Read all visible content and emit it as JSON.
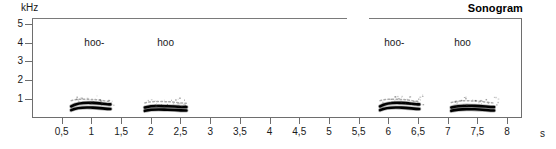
{
  "title": "Sonogram",
  "axes": {
    "y_unit": "kHz",
    "x_unit": "s",
    "y_ticks": [
      {
        "value": 5,
        "label": "5"
      },
      {
        "value": 4,
        "label": "4"
      },
      {
        "value": 3,
        "label": "3"
      },
      {
        "value": 2,
        "label": "2"
      },
      {
        "value": 1,
        "label": "1"
      }
    ],
    "x_ticks": [
      {
        "value": 0.5,
        "label": "0,5"
      },
      {
        "value": 1.0,
        "label": "1"
      },
      {
        "value": 1.5,
        "label": "1,5"
      },
      {
        "value": 2.0,
        "label": "2"
      },
      {
        "value": 2.5,
        "label": "2,5"
      },
      {
        "value": 3.0,
        "label": "3"
      },
      {
        "value": 3.5,
        "label": "3,5"
      },
      {
        "value": 4.0,
        "label": "4"
      },
      {
        "value": 4.5,
        "label": "4,5"
      },
      {
        "value": 5.0,
        "label": "5"
      },
      {
        "value": 5.5,
        "label": "5,5"
      },
      {
        "value": 6.0,
        "label": "6"
      },
      {
        "value": 6.5,
        "label": "6,5"
      },
      {
        "value": 7.0,
        "label": "7"
      },
      {
        "value": 7.5,
        "label": "7,5"
      },
      {
        "value": 8.0,
        "label": "8"
      }
    ]
  },
  "annotations": [
    {
      "text": "hoo-",
      "x": 1.05,
      "y": 4.0
    },
    {
      "text": "hoo",
      "x": 2.25,
      "y": 4.0
    },
    {
      "text": "hoo-",
      "x": 6.1,
      "y": 4.0
    },
    {
      "text": "hoo",
      "x": 7.25,
      "y": 4.0
    }
  ],
  "chart_data": {
    "type": "heatmap",
    "title": "Sonogram",
    "xlabel": "s",
    "ylabel": "kHz",
    "xlim": [
      0,
      8.25
    ],
    "ylim": [
      0,
      5.3
    ],
    "grid": false,
    "legend": null,
    "calls": [
      {
        "label": "hoo-",
        "t_start": 0.66,
        "t_end": 1.32,
        "peak_freq": 0.8,
        "bands": [
          {
            "name": "upper-harmonic",
            "f_start": 0.62,
            "f_peak": 0.8,
            "f_end": 0.72,
            "intensity": "strong"
          },
          {
            "name": "fundamental",
            "f_start": 0.42,
            "f_peak": 0.55,
            "f_end": 0.48,
            "intensity": "strong"
          },
          {
            "name": "overtone-speckle",
            "f_start": 0.92,
            "f_peak": 0.98,
            "f_end": 0.88,
            "intensity": "faint"
          }
        ]
      },
      {
        "label": "hoo",
        "t_start": 1.9,
        "t_end": 2.6,
        "peak_freq": 0.62,
        "bands": [
          {
            "name": "upper-harmonic",
            "f_start": 0.56,
            "f_peak": 0.62,
            "f_end": 0.58,
            "intensity": "strong"
          },
          {
            "name": "fundamental",
            "f_start": 0.38,
            "f_peak": 0.44,
            "f_end": 0.4,
            "intensity": "strong"
          },
          {
            "name": "overtone-speckle",
            "f_start": 0.8,
            "f_peak": 0.86,
            "f_end": 0.78,
            "intensity": "faint"
          }
        ]
      },
      {
        "label": "hoo-",
        "t_start": 5.86,
        "t_end": 6.52,
        "peak_freq": 0.8,
        "bands": [
          {
            "name": "upper-harmonic",
            "f_start": 0.62,
            "f_peak": 0.8,
            "f_end": 0.72,
            "intensity": "strong"
          },
          {
            "name": "fundamental",
            "f_start": 0.42,
            "f_peak": 0.55,
            "f_end": 0.48,
            "intensity": "strong"
          },
          {
            "name": "overtone-speckle",
            "f_start": 0.92,
            "f_peak": 0.98,
            "f_end": 0.88,
            "intensity": "faint"
          }
        ]
      },
      {
        "label": "hoo",
        "t_start": 7.06,
        "t_end": 7.78,
        "peak_freq": 0.64,
        "bands": [
          {
            "name": "upper-harmonic",
            "f_start": 0.56,
            "f_peak": 0.64,
            "f_end": 0.58,
            "intensity": "strong"
          },
          {
            "name": "fundamental",
            "f_start": 0.38,
            "f_peak": 0.46,
            "f_end": 0.4,
            "intensity": "strong"
          },
          {
            "name": "overtone-speckle",
            "f_start": 0.82,
            "f_peak": 0.9,
            "f_end": 0.8,
            "intensity": "faint"
          }
        ]
      }
    ]
  }
}
